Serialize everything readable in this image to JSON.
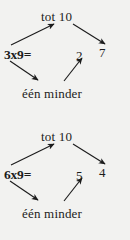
{
  "page": {
    "background_color": "#f2f2f0",
    "ink_color": "#1c1c1c"
  },
  "diagrams": [
    {
      "id": "diagram-1",
      "top_label": "tot 10",
      "bottom_label": "één minder",
      "equation": "3x9=",
      "tens_digit": "2",
      "units_digit": "7"
    },
    {
      "id": "diagram-2",
      "top_label": "tot 10",
      "bottom_label": "één minder",
      "equation": "6x9=",
      "tens_digit": "5",
      "units_digit": "4"
    }
  ],
  "arrows": {
    "up_right_name": "arrow-equation-to-tot10",
    "down_right_name": "arrow-equation-to-een-minder",
    "top_down_right_name": "arrow-tot10-to-units",
    "up_to_tens_name": "arrow-een-minder-to-tens"
  }
}
